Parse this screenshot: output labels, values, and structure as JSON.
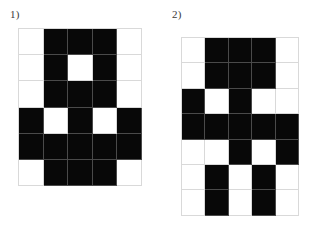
{
  "page": {
    "background_color": "#ffffff",
    "fill_color": "#080808",
    "empty_color": "#ffffff",
    "gridline_color": "#d9d9d9",
    "label_color": "#3a3a3a"
  },
  "puzzles": [
    {
      "id": "puzzle-1",
      "label": "1)",
      "columns": 5,
      "rows": 6,
      "grid": [
        [
          0,
          1,
          1,
          1,
          0
        ],
        [
          0,
          1,
          0,
          1,
          0
        ],
        [
          0,
          1,
          1,
          1,
          0
        ],
        [
          1,
          0,
          1,
          0,
          1
        ],
        [
          1,
          1,
          1,
          1,
          1
        ],
        [
          0,
          1,
          1,
          1,
          0
        ]
      ]
    },
    {
      "id": "puzzle-2",
      "label": "2)",
      "columns": 5,
      "rows": 7,
      "grid": [
        [
          0,
          1,
          1,
          1,
          0
        ],
        [
          0,
          1,
          1,
          1,
          0
        ],
        [
          1,
          0,
          1,
          0,
          0
        ],
        [
          1,
          1,
          1,
          1,
          1
        ],
        [
          0,
          0,
          1,
          0,
          1
        ],
        [
          0,
          1,
          0,
          1,
          0
        ],
        [
          0,
          1,
          0,
          1,
          0
        ]
      ]
    }
  ]
}
